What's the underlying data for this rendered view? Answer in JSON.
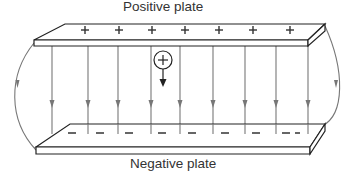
{
  "labels": {
    "top": "Positive plate",
    "bottom": "Negative plate"
  },
  "plates": {
    "positive": {
      "charge_symbol": "+",
      "count": 7
    },
    "negative": {
      "charge_symbol": "−",
      "count": 9
    }
  },
  "test_charge": {
    "symbol": "+",
    "direction": "down"
  },
  "field_lines": {
    "count": 9,
    "side_curves": 2,
    "direction": "positive-to-negative"
  },
  "colors": {
    "line": "#555555",
    "plate": "#222222",
    "text": "#333333"
  }
}
